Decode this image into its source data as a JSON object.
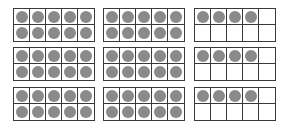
{
  "diagram": {
    "dot_color": "#8a8a8a",
    "line_color": "#3a3a3a",
    "rows": [
      {
        "frames": [
          {
            "count": 10
          },
          {
            "count": 10
          },
          {
            "count": 4
          }
        ]
      },
      {
        "frames": [
          {
            "count": 10
          },
          {
            "count": 10
          },
          {
            "count": 4
          }
        ]
      },
      {
        "frames": [
          {
            "count": 10
          },
          {
            "count": 10
          },
          {
            "count": 4
          }
        ]
      }
    ]
  }
}
